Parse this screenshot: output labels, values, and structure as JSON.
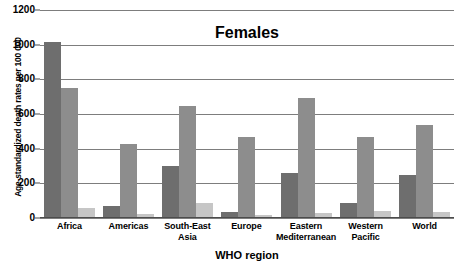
{
  "chart_data": {
    "type": "bar",
    "title": "Females",
    "xlabel": "WHO region",
    "ylabel": "Age-standardized death rates per 100 000",
    "ylim": [
      0,
      1200
    ],
    "ytick_step": 200,
    "yticks": [
      "0",
      "200",
      "400",
      "600",
      "800",
      "1000",
      "1200"
    ],
    "grid": true,
    "legend": "none",
    "categories": [
      "Africa",
      "Americas",
      "South-East\nAsia",
      "Europe",
      "Eastern\nMediterranean",
      "Western\nPacific",
      "World"
    ],
    "category_lines": [
      [
        "Africa"
      ],
      [
        "Americas"
      ],
      [
        "South-East",
        "Asia"
      ],
      [
        "Europe"
      ],
      [
        "Eastern",
        "Mediterranean"
      ],
      [
        "Western",
        "Pacific"
      ],
      [
        "World"
      ]
    ],
    "series": [
      {
        "name": "series-1",
        "color": "#6e6e6e",
        "values": [
          1015,
          72,
          300,
          35,
          260,
          85,
          250
        ]
      },
      {
        "name": "series-2",
        "color": "#8d8d8d",
        "values": [
          750,
          425,
          645,
          470,
          690,
          470,
          535
        ]
      },
      {
        "name": "series-3",
        "color": "#c6c6c6",
        "values": [
          60,
          25,
          85,
          15,
          30,
          40,
          35
        ]
      }
    ]
  },
  "colors": {
    "gridline": "#7d7d7d",
    "axis": "#4c4c4c",
    "text": "#000000",
    "background": "#ffffff"
  }
}
